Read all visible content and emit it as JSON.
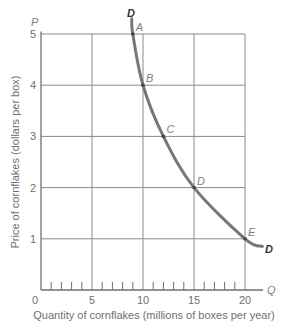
{
  "chart_data": {
    "type": "line",
    "title": "",
    "xlabel": "Quantity of cornflakes (millions of boxes per year)",
    "ylabel": "Price of cornflakes (dollars per box)",
    "x_axis_symbol": "Q",
    "y_axis_symbol": "P",
    "xlim": [
      0,
      20
    ],
    "ylim": [
      0,
      5
    ],
    "x_ticks": [
      0,
      5,
      10,
      15,
      20
    ],
    "y_ticks": [
      1,
      2,
      3,
      4,
      5
    ],
    "x_minor_ticks_every": 1,
    "grid": true,
    "legend": null,
    "series": [
      {
        "name": "D",
        "label_start": "D",
        "label_end": "D",
        "color": "#777777",
        "points": [
          {
            "label": "A",
            "x": 9,
            "y": 5
          },
          {
            "label": "B",
            "x": 10,
            "y": 4
          },
          {
            "label": "C",
            "x": 12,
            "y": 3
          },
          {
            "label": "D",
            "x": 15,
            "y": 2
          },
          {
            "label": "E",
            "x": 20,
            "y": 1
          }
        ],
        "curve_extends_from": {
          "x": 8.9,
          "y": 5.3
        },
        "curve_extends_to": {
          "x": 21.7,
          "y": 0.85
        }
      }
    ]
  },
  "colors": {
    "grid": "#8a8a8a",
    "axis": "#707070",
    "curve": "#777777",
    "text": "#707070",
    "curve_label": "#333333"
  }
}
